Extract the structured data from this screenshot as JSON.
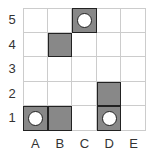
{
  "grid": {
    "columns": [
      "A",
      "B",
      "C",
      "D",
      "E"
    ],
    "rows": [
      "5",
      "4",
      "3",
      "2",
      "1"
    ],
    "colors": {
      "filled": "#888888",
      "border": "#222222",
      "gridline": "#cccccc",
      "circle": "#ffffff"
    },
    "filled_cells": [
      {
        "cell": "C5",
        "col": 2,
        "row": 0,
        "circle": true
      },
      {
        "cell": "B4",
        "col": 1,
        "row": 1,
        "circle": false
      },
      {
        "cell": "D2",
        "col": 3,
        "row": 3,
        "circle": false
      },
      {
        "cell": "A1",
        "col": 0,
        "row": 4,
        "circle": true
      },
      {
        "cell": "B1",
        "col": 1,
        "row": 4,
        "circle": false
      },
      {
        "cell": "D1",
        "col": 3,
        "row": 4,
        "circle": true
      }
    ]
  }
}
